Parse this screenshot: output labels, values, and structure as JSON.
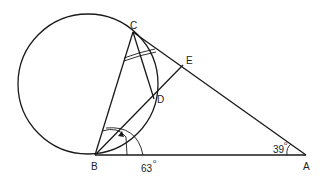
{
  "diagram": {
    "type": "geometry",
    "points": {
      "A": {
        "label": "A",
        "x": 306,
        "y": 155
      },
      "B": {
        "label": "B",
        "x": 95,
        "y": 155
      },
      "C": {
        "label": "C",
        "x": 133,
        "y": 32
      },
      "D": {
        "label": "D",
        "x": 154,
        "y": 99
      },
      "E": {
        "label": "E",
        "x": 183,
        "y": 65
      }
    },
    "circle": {
      "cx": 88,
      "cy": 84,
      "r": 70,
      "through": [
        "B",
        "C",
        "D"
      ]
    },
    "segments": [
      "BA",
      "CA",
      "BC",
      "BD",
      "CD",
      "BE",
      "DE"
    ],
    "angles": {
      "A": {
        "value": "39",
        "unit": "°",
        "label": "39°"
      },
      "B": {
        "value": "63",
        "unit": "°",
        "label": "63°"
      }
    },
    "labels": {
      "A": "A",
      "B": "B",
      "C": "C",
      "D": "D",
      "E": "E",
      "angle_A": "39",
      "angle_A_deg": "o",
      "angle_B": "63",
      "angle_B_deg": "o"
    },
    "marks": {
      "angle_C_double_arcs": 2,
      "angle_B_arrow_arc": 1
    }
  }
}
